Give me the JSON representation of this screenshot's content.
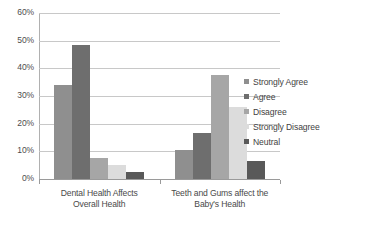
{
  "chart_data": {
    "type": "bar",
    "title": "",
    "xlabel": "",
    "ylabel": "",
    "ylim": [
      0,
      60
    ],
    "ytick_labels": [
      "60%",
      "50%",
      "40%",
      "30%",
      "20%",
      "10%",
      "0%"
    ],
    "ytick_values": [
      60,
      50,
      40,
      30,
      20,
      10,
      0
    ],
    "grid": true,
    "legend_position": "right",
    "categories": [
      "Dental Health Affects Overall Health",
      "Teeth and Gums affect the Baby's Health"
    ],
    "category_lines": [
      [
        "Dental Health Affects",
        "Overall Health"
      ],
      [
        "Teeth and Gums affect the",
        "Baby's Health"
      ]
    ],
    "series": [
      {
        "name": "Strongly Agree",
        "color": "#8f8f8f",
        "values": [
          34.0,
          10.5
        ]
      },
      {
        "name": "Agree",
        "color": "#6e6e6e",
        "values": [
          48.5,
          16.5
        ]
      },
      {
        "name": "Disagree",
        "color": "#a6a6a6",
        "values": [
          7.5,
          37.5
        ]
      },
      {
        "name": "Strongly Disagree",
        "color": "#dcdcdc",
        "values": [
          5.0,
          26.0
        ]
      },
      {
        "name": "Neutral",
        "color": "#595959",
        "values": [
          2.5,
          6.5
        ]
      }
    ]
  },
  "legend": {
    "items": [
      {
        "label": "Strongly Agree"
      },
      {
        "label": "Agree"
      },
      {
        "label": "Disagree"
      },
      {
        "label": "Strongly Disagree"
      },
      {
        "label": "Neutral"
      }
    ]
  }
}
